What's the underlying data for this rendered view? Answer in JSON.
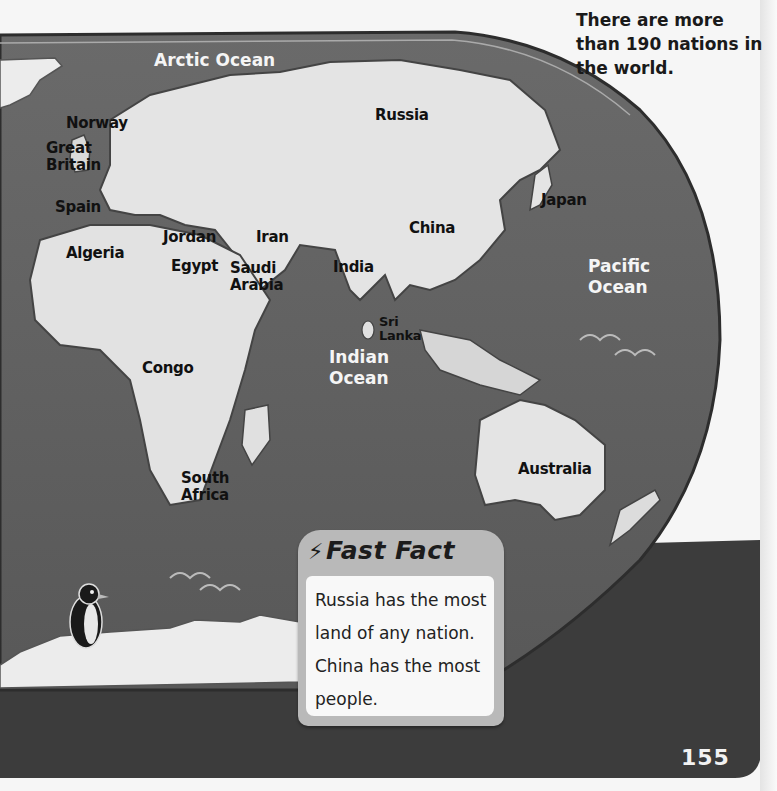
{
  "page": {
    "intro_text": "There are more than 190 nations in the world.",
    "page_number": "155"
  },
  "map": {
    "countries": [
      {
        "name": "Russia",
        "x": 375,
        "y": 107
      },
      {
        "name": "Norway",
        "x": 66,
        "y": 115
      },
      {
        "name": "Great\nBritain",
        "x": 46,
        "y": 140
      },
      {
        "name": "Spain",
        "x": 55,
        "y": 199
      },
      {
        "name": "Jordan",
        "x": 163,
        "y": 229
      },
      {
        "name": "Iran",
        "x": 256,
        "y": 229
      },
      {
        "name": "Algeria",
        "x": 66,
        "y": 245
      },
      {
        "name": "Egypt",
        "x": 171,
        "y": 258
      },
      {
        "name": "Saudi\nArabia",
        "x": 230,
        "y": 260
      },
      {
        "name": "India",
        "x": 333,
        "y": 259
      },
      {
        "name": "China",
        "x": 409,
        "y": 220
      },
      {
        "name": "Japan",
        "x": 541,
        "y": 192
      },
      {
        "name": "Sri\nLanka",
        "x": 379,
        "y": 315
      },
      {
        "name": "Congo",
        "x": 142,
        "y": 360
      },
      {
        "name": "South\nAfrica",
        "x": 181,
        "y": 470
      },
      {
        "name": "Australia",
        "x": 518,
        "y": 461
      }
    ],
    "oceans": [
      {
        "name": "Arctic Ocean",
        "x": 154,
        "y": 50
      },
      {
        "name": "Pacific\nOcean",
        "x": 588,
        "y": 256
      },
      {
        "name": "Indian\nOcean",
        "x": 329,
        "y": 347
      }
    ],
    "illustration": "penguin-on-antarctica"
  },
  "fast_fact": {
    "icon": "lightning-bolt-icon",
    "title": "Fast Fact",
    "text": "Russia has the most land of any nation. China has the most people."
  },
  "colors": {
    "ocean": "#6e6e6e",
    "land": "#e2e2e2",
    "page": "#f6f6f6",
    "dark_band": "#3a3a3a"
  }
}
